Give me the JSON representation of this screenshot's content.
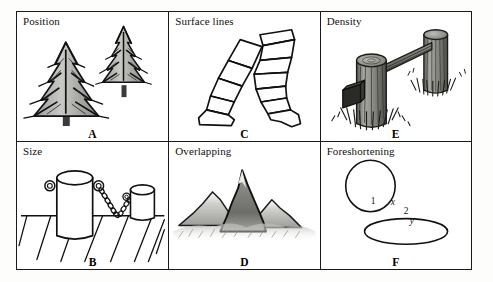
{
  "figure": {
    "layout": "2 rows x 3 columns grid of bordered panels",
    "background_color": "#ffffff",
    "line_color": "#1a1a1a"
  },
  "panels": [
    {
      "id": "position",
      "title": "Position",
      "letter": "A",
      "subject": "two fir trees, the larger one lower-left and the smaller one upper-right",
      "row": "top",
      "column": "left"
    },
    {
      "id": "surface-lines",
      "title": "Surface lines",
      "letter": "C",
      "subject": "pair of legs in trousers drawn with contour bands wrapping the form",
      "row": "top",
      "column": "middle"
    },
    {
      "id": "density",
      "title": "Density",
      "letter": "E",
      "subject": "two wooden fence posts joined by a diagonal rail with grass tufts",
      "row": "top",
      "column": "right"
    },
    {
      "id": "size",
      "title": "Size",
      "letter": "B",
      "subject": "two cylindrical bollards linked by chains on a planked surface",
      "row": "bottom",
      "column": "left"
    },
    {
      "id": "overlapping",
      "title": "Overlapping",
      "letter": "D",
      "subject": "three mountain peaks where the dark central peak overlaps paler peaks behind",
      "row": "bottom",
      "column": "middle"
    },
    {
      "id": "foreshortening",
      "title": "Foreshortening",
      "letter": "F",
      "subject": "a circle above a flattened ellipse with axis annotations",
      "row": "bottom",
      "column": "right",
      "annotations": {
        "circle_number": "1",
        "ellipse_number": "2",
        "axis_x": "x",
        "axis_y": "y"
      }
    }
  ]
}
